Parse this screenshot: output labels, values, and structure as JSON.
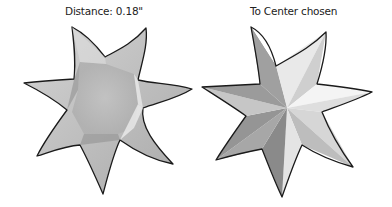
{
  "panels": [
    {
      "caption": "Distance: 0.18\"",
      "shape": "six-point-star",
      "shading": "flat-beveled"
    },
    {
      "caption": "To Center chosen",
      "shape": "six-point-star",
      "shading": "faceted-to-center"
    }
  ],
  "colors": {
    "outline": "#1a1a1a",
    "fill_light": "#f2f2f2",
    "fill_mid": "#b8b8b8",
    "fill_dark": "#7a7a7a"
  }
}
